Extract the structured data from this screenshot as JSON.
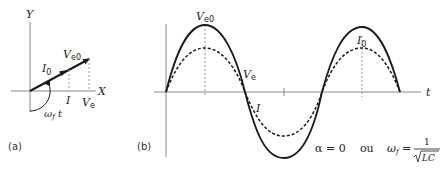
{
  "panel_a": {
    "tag": "(a)",
    "axis_x": "X",
    "axis_y": "Y",
    "vector_current": {
      "main": "I",
      "sub": "0"
    },
    "vector_voltage": {
      "main": "V",
      "sub": "e0"
    },
    "proj_current": "I",
    "proj_voltage": {
      "main": "V",
      "sub": "e"
    },
    "angle": {
      "main": "ω",
      "sub": "f",
      "tail": " t"
    }
  },
  "panel_b": {
    "tag": "(b)",
    "axis_t": "t",
    "peak_voltage": {
      "main": "V",
      "sub": "e0"
    },
    "peak_current": {
      "main": "I",
      "sub": "0"
    },
    "curve_voltage": {
      "main": "V",
      "sub": "e"
    },
    "curve_current": "I",
    "condition_alpha": "α = 0",
    "conjunction": "ou",
    "condition_omega": {
      "main": "ω",
      "sub": "f",
      "eq": " = ",
      "numerator": "1",
      "denominator": "LC"
    }
  },
  "colors": {
    "stroke": "#1a1a1a",
    "axis": "#888888",
    "dashed_guide": "#999999"
  }
}
